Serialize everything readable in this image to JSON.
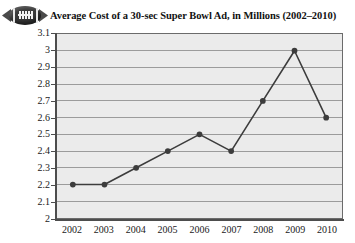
{
  "header": {
    "icon": "football-icon",
    "title": "Average Cost of a 30-sec Super Bowl Ad, in Millions (2002–2010)"
  },
  "chart_data": {
    "type": "line",
    "title": "Average Cost of a 30-sec Super Bowl Ad, in Millions (2002–2010)",
    "xlabel": "",
    "ylabel": "",
    "categories": [
      "2002",
      "2003",
      "2004",
      "2005",
      "2006",
      "2007",
      "2008",
      "2009",
      "2010"
    ],
    "values": [
      2.2,
      2.2,
      2.3,
      2.4,
      2.5,
      2.4,
      2.7,
      3.0,
      2.6
    ],
    "ylim": [
      2,
      3.1
    ],
    "ytick_labels": [
      "3.1",
      "3",
      "2.9",
      "2.8",
      "2.7",
      "2.6",
      "2.5",
      "2.4",
      "2.3",
      "2.2",
      "2.1",
      "2"
    ],
    "ytick_values": [
      3.1,
      3.0,
      2.9,
      2.8,
      2.7,
      2.6,
      2.5,
      2.4,
      2.3,
      2.2,
      2.1,
      2.0
    ],
    "grid": true,
    "legend": false,
    "marker": "circle",
    "series_color": "#3c3c3c",
    "plot_background": "#ebebeb",
    "grid_color": "#9a9a9a",
    "axis_color": "#4d4d4d"
  }
}
